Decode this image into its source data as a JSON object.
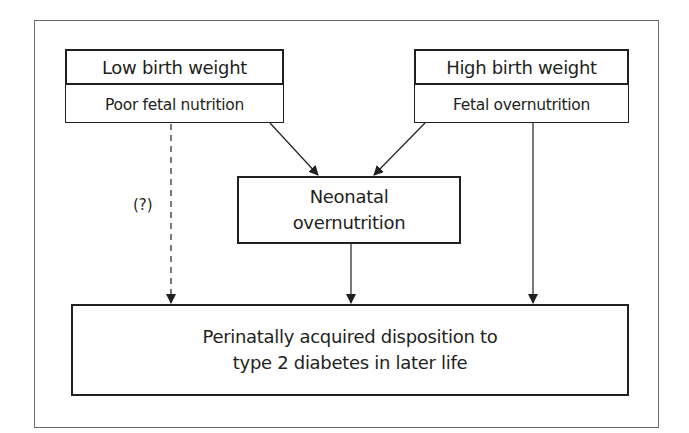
{
  "diagram": {
    "nodes": {
      "low": {
        "title": "Low birth weight",
        "subtitle": "Poor fetal nutrition"
      },
      "high": {
        "title": "High birth weight",
        "subtitle": "Fetal overnutrition"
      },
      "neonatal": {
        "line1": "Neonatal",
        "line2": "overnutrition"
      },
      "outcome": {
        "line1": "Perinatally acquired disposition to",
        "line2": "type 2 diabetes in later life"
      }
    },
    "edges": [
      {
        "from": "low",
        "to": "neonatal",
        "style": "solid"
      },
      {
        "from": "high",
        "to": "neonatal",
        "style": "solid"
      },
      {
        "from": "low",
        "to": "outcome",
        "style": "dashed",
        "label": "(?)"
      },
      {
        "from": "neonatal",
        "to": "outcome",
        "style": "solid"
      },
      {
        "from": "high",
        "to": "outcome",
        "style": "solid"
      }
    ],
    "uncertain_label": "(?)"
  },
  "colors": {
    "line": "#231f20",
    "frame": "#6b6b6b",
    "background": "#ffffff"
  }
}
